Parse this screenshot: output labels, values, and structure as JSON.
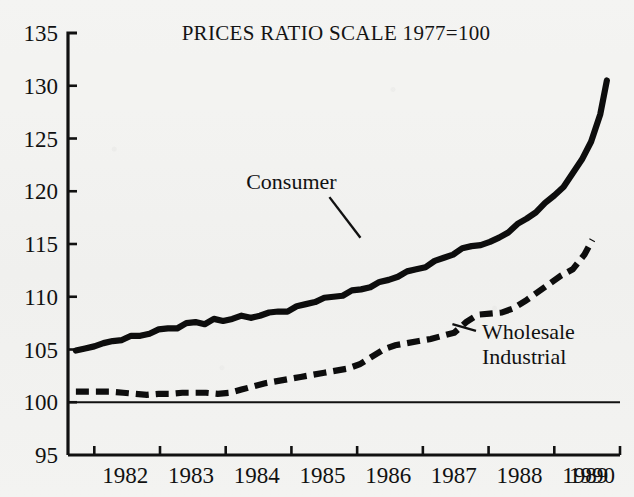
{
  "chart_data": {
    "type": "line",
    "title": "PRICES RATIO SCALE 1977=100",
    "xlabel": "",
    "ylabel": "",
    "xlim": [
      1981.6,
      1990.0
    ],
    "ylim": [
      95,
      135
    ],
    "yticks": [
      95,
      100,
      105,
      110,
      115,
      120,
      125,
      130,
      135
    ],
    "xticks": [
      1982,
      1983,
      1984,
      1985,
      1986,
      1987,
      1988,
      1989,
      1990
    ],
    "xtick_labels": [
      "1982",
      "1983",
      "1984",
      "1985",
      "1986",
      "1987",
      "1988",
      "1989",
      "1990"
    ],
    "ytick_labels": [
      "95",
      "100",
      "105",
      "110",
      "115",
      "120",
      "125",
      "130",
      "135"
    ],
    "grid": false,
    "legend_position": "inline-annotation",
    "reference_lines": [
      {
        "name": "base-100-line",
        "y": 100,
        "style": "solid"
      }
    ],
    "annotations": [
      {
        "name": "consumer-annotation",
        "text": "Consumer",
        "x": 1985.0,
        "y": 120.2,
        "points_to": [
          1986.05,
          115.6
        ]
      },
      {
        "name": "wholesale-annotation",
        "text": "Wholesale",
        "x": 1987.9,
        "y": 106.0,
        "points_to": [
          1987.45,
          107.4
        ]
      },
      {
        "name": "industrial-annotation",
        "text": "Industrial",
        "x": 1987.9,
        "y": 103.6,
        "points_to": null
      }
    ],
    "series": [
      {
        "name": "Consumer",
        "style": "solid",
        "x": [
          1981.72,
          1981.86,
          1982.0,
          1982.14,
          1982.28,
          1982.42,
          1982.56,
          1982.7,
          1982.84,
          1982.98,
          1983.12,
          1983.26,
          1983.4,
          1983.54,
          1983.68,
          1983.82,
          1983.96,
          1984.1,
          1984.24,
          1984.38,
          1984.52,
          1984.66,
          1984.8,
          1984.94,
          1985.08,
          1985.22,
          1985.36,
          1985.5,
          1985.64,
          1985.78,
          1985.92,
          1986.06,
          1986.2,
          1986.34,
          1986.48,
          1986.62,
          1986.76,
          1986.9,
          1987.04,
          1987.18,
          1987.32,
          1987.46,
          1987.6,
          1987.74,
          1987.88,
          1988.02,
          1988.16,
          1988.3,
          1988.44,
          1988.58,
          1988.72,
          1988.86,
          1989.0,
          1989.14,
          1989.28,
          1989.42,
          1989.56,
          1989.7,
          1989.8
        ],
        "y": [
          104.8,
          105.1,
          105.4,
          105.5,
          105.8,
          106.0,
          106.2,
          106.3,
          106.6,
          106.8,
          107.0,
          107.1,
          107.4,
          107.6,
          107.5,
          107.8,
          107.7,
          108.0,
          108.1,
          108.0,
          108.3,
          108.4,
          108.6,
          108.7,
          109.0,
          109.3,
          109.6,
          109.8,
          110.0,
          110.2,
          110.5,
          110.7,
          111.0,
          111.3,
          111.6,
          112.0,
          112.3,
          112.6,
          112.9,
          113.3,
          113.7,
          114.1,
          114.5,
          114.8,
          115.0,
          115.1,
          115.6,
          116.2,
          116.8,
          117.4,
          118.1,
          118.8,
          119.6,
          120.5,
          121.6,
          123.0,
          124.8,
          127.2,
          130.5
        ]
      },
      {
        "name": "Wholesale Industrial",
        "style": "dashed",
        "x": [
          1981.72,
          1981.9,
          1982.08,
          1982.26,
          1982.44,
          1982.62,
          1982.8,
          1982.98,
          1983.16,
          1983.34,
          1983.52,
          1983.7,
          1983.88,
          1984.06,
          1984.24,
          1984.42,
          1984.6,
          1984.78,
          1984.96,
          1985.14,
          1985.32,
          1985.5,
          1985.68,
          1985.86,
          1986.04,
          1986.22,
          1986.4,
          1986.58,
          1986.76,
          1986.94,
          1987.12,
          1987.3,
          1987.48,
          1987.66,
          1987.84,
          1988.02,
          1988.2,
          1988.38,
          1988.56,
          1988.74,
          1988.92,
          1989.1,
          1989.28,
          1989.46,
          1989.58
        ],
        "y": [
          101.0,
          101.0,
          101.0,
          101.0,
          100.9,
          100.8,
          100.7,
          100.8,
          100.8,
          100.9,
          100.9,
          100.9,
          100.8,
          100.9,
          101.2,
          101.5,
          101.8,
          102.0,
          102.2,
          102.4,
          102.6,
          102.8,
          103.0,
          103.2,
          103.6,
          104.3,
          105.0,
          105.4,
          105.6,
          105.8,
          106.0,
          106.3,
          106.6,
          107.6,
          108.3,
          108.4,
          108.5,
          108.9,
          109.6,
          110.4,
          111.2,
          112.0,
          112.6,
          114.0,
          115.4
        ]
      }
    ]
  }
}
